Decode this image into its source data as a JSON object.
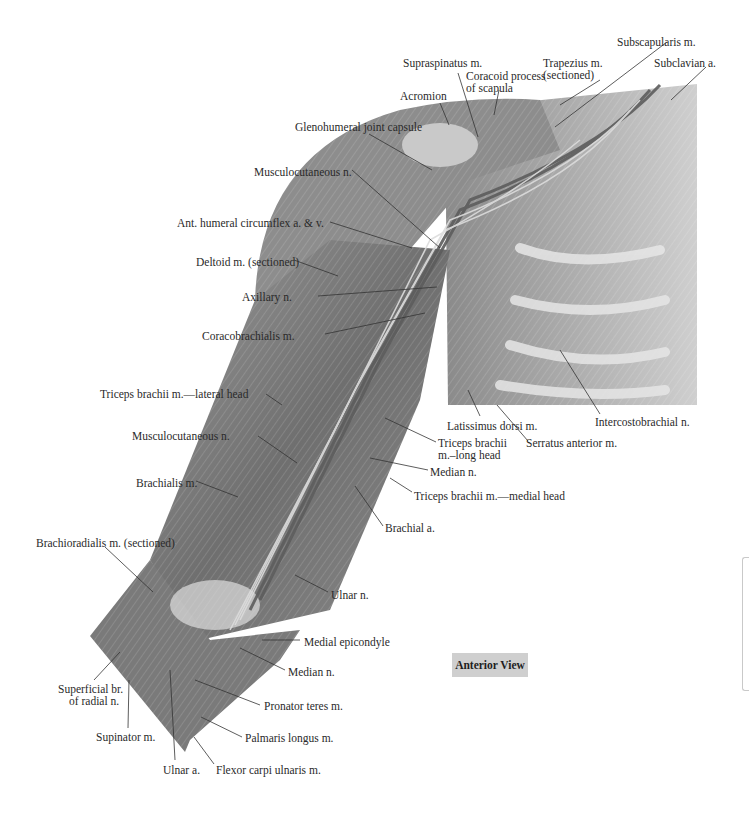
{
  "figure": {
    "view_label": "Anterior View",
    "colors": {
      "background": "#ffffff",
      "badge": "#cfcfcf",
      "leader": "#333333"
    },
    "labels": [
      {
        "id": "supraspinatus",
        "text": "Supraspinatus m.",
        "x": 403,
        "y": 57
      },
      {
        "id": "trapezius",
        "text": "Trapezius m.",
        "x": 543,
        "y": 57
      },
      {
        "id": "trapezius2",
        "text": "(sectioned)",
        "x": 543,
        "y": 69
      },
      {
        "id": "subscapularis",
        "text": "Subscapularis m.",
        "x": 617,
        "y": 36
      },
      {
        "id": "subclavian",
        "text": "Subclavian a.",
        "x": 654,
        "y": 57
      },
      {
        "id": "coracoid",
        "text": "Coracoid process",
        "x": 466,
        "y": 70
      },
      {
        "id": "coracoid2",
        "text": "of scapula",
        "x": 466,
        "y": 82
      },
      {
        "id": "acromion",
        "text": "Acromion",
        "x": 400,
        "y": 90
      },
      {
        "id": "glenohumeral",
        "text": "Glenohumeral joint capsule",
        "x": 295,
        "y": 121
      },
      {
        "id": "musculocutaneous_top",
        "text": "Musculocutaneous n.",
        "x": 254,
        "y": 166
      },
      {
        "id": "ant_humeral",
        "text": "Ant. humeral circumflex a. & v.",
        "x": 177,
        "y": 217
      },
      {
        "id": "deltoid",
        "text": "Deltoid m. (sectioned)",
        "x": 196,
        "y": 256
      },
      {
        "id": "axillary",
        "text": "Axillary n.",
        "x": 242,
        "y": 291
      },
      {
        "id": "coracobrachialis",
        "text": "Coracobrachialis m.",
        "x": 202,
        "y": 330
      },
      {
        "id": "latissimus",
        "text": "Latissimus dorsi m.",
        "x": 447,
        "y": 420
      },
      {
        "id": "intercostobrachial",
        "text": "Intercostobrachial n.",
        "x": 595,
        "y": 416
      },
      {
        "id": "serratus",
        "text": "Serratus anterior m.",
        "x": 526,
        "y": 437
      },
      {
        "id": "triceps_long",
        "text": "Triceps brachii",
        "x": 438,
        "y": 437
      },
      {
        "id": "triceps_long2",
        "text": "m.–long head",
        "x": 438,
        "y": 449
      },
      {
        "id": "median_top",
        "text": "Median n.",
        "x": 430,
        "y": 466
      },
      {
        "id": "triceps_medial",
        "text": "Triceps brachii m.—medial head",
        "x": 414,
        "y": 490
      },
      {
        "id": "triceps_lateral",
        "text": "Triceps brachii m.—lateral head",
        "x": 100,
        "y": 388
      },
      {
        "id": "musculocutaneous_mid",
        "text": "Musculocutaneous n.",
        "x": 132,
        "y": 430
      },
      {
        "id": "brachialis",
        "text": "Brachialis m.",
        "x": 136,
        "y": 477
      },
      {
        "id": "brachial_a",
        "text": "Brachial a.",
        "x": 385,
        "y": 522
      },
      {
        "id": "brachioradialis",
        "text": "Brachioradialis m. (sectioned)",
        "x": 36,
        "y": 537
      },
      {
        "id": "ulnar_n",
        "text": "Ulnar n.",
        "x": 331,
        "y": 589
      },
      {
        "id": "medial_epicondyle",
        "text": "Medial epicondyle",
        "x": 304,
        "y": 636
      },
      {
        "id": "median_bottom",
        "text": "Median n.",
        "x": 288,
        "y": 666
      },
      {
        "id": "superficial_br",
        "text": "Superficial br.",
        "x": 58,
        "y": 683
      },
      {
        "id": "superficial_br2",
        "text": "of radial n.",
        "x": 69,
        "y": 695
      },
      {
        "id": "pronator",
        "text": "Pronator teres m.",
        "x": 264,
        "y": 700
      },
      {
        "id": "palmaris",
        "text": "Palmaris longus m.",
        "x": 245,
        "y": 732
      },
      {
        "id": "supinator",
        "text": "Supinator m.",
        "x": 96,
        "y": 731
      },
      {
        "id": "ulnar_a",
        "text": "Ulnar a.",
        "x": 163,
        "y": 764
      },
      {
        "id": "flexor_carpi",
        "text": "Flexor carpi ulnaris m.",
        "x": 216,
        "y": 764
      }
    ],
    "leaders": [
      [
        458,
        73,
        478,
        137
      ],
      [
        600,
        80,
        560,
        105
      ],
      [
        667,
        42,
        555,
        127
      ],
      [
        706,
        67,
        671,
        100
      ],
      [
        499,
        90,
        494,
        115
      ],
      [
        440,
        103,
        449,
        125
      ],
      [
        369,
        134,
        432,
        170
      ],
      [
        352,
        170,
        440,
        248
      ],
      [
        330,
        222,
        412,
        248
      ],
      [
        294,
        260,
        338,
        276
      ],
      [
        318,
        296,
        437,
        287
      ],
      [
        325,
        334,
        425,
        313
      ],
      [
        480,
        416,
        468,
        390
      ],
      [
        600,
        414,
        560,
        350
      ],
      [
        528,
        441,
        497,
        405
      ],
      [
        436,
        442,
        385,
        418
      ],
      [
        428,
        470,
        370,
        458
      ],
      [
        412,
        492,
        390,
        478
      ],
      [
        266,
        394,
        282,
        405
      ],
      [
        258,
        436,
        297,
        463
      ],
      [
        196,
        481,
        238,
        497
      ],
      [
        383,
        526,
        355,
        486
      ],
      [
        105,
        547,
        153,
        592
      ],
      [
        328,
        592,
        295,
        575
      ],
      [
        300,
        640,
        262,
        640
      ],
      [
        285,
        670,
        240,
        648
      ],
      [
        94,
        680,
        120,
        652
      ],
      [
        260,
        705,
        195,
        680
      ],
      [
        242,
        737,
        201,
        717
      ],
      [
        128,
        728,
        129,
        680
      ],
      [
        175,
        760,
        170,
        670
      ],
      [
        214,
        764,
        194,
        737
      ]
    ]
  }
}
